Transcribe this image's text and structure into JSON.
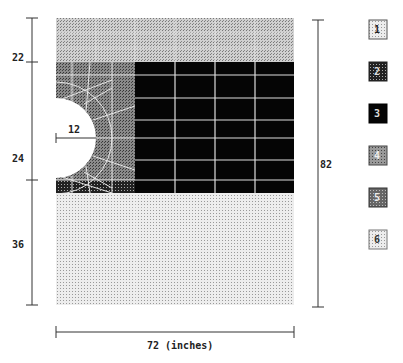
{
  "figure": {
    "type": "finite-element mesh of plate with semicircular hole",
    "units_label": "72 (inches)",
    "dimensions": {
      "left": [
        {
          "label": "22",
          "value": 22
        },
        {
          "label": "24",
          "value": 24
        },
        {
          "label": "36",
          "value": 36
        }
      ],
      "right": {
        "label": "82",
        "value": 82
      },
      "bottom": {
        "label": "72 (inches)",
        "value": 72
      },
      "hole_radius": {
        "label": "12",
        "value": 12
      }
    },
    "legend": [
      {
        "id": "1",
        "label": "1",
        "fill": "#d6d6d6"
      },
      {
        "id": "2",
        "label": "2",
        "fill": "#2a2a2a"
      },
      {
        "id": "3",
        "label": "3",
        "fill": "#000000"
      },
      {
        "id": "4",
        "label": "4",
        "fill": "#9a9a9a"
      },
      {
        "id": "5",
        "label": "5",
        "fill": "#6a6a6a"
      },
      {
        "id": "6",
        "label": "6",
        "fill": "#e0e0e0"
      }
    ],
    "colors": {
      "region_top": "#cfcfcf",
      "region_mesh_left": "#7a7a7a",
      "region_black": "#050505",
      "region_bottom": "#e2e2e2",
      "grid_line": "#e8e8e8",
      "dim_line": "#333333"
    }
  }
}
